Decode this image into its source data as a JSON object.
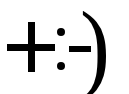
{
  "emoticon": {
    "text": "+:-)",
    "parts": {
      "plus": "+",
      "colon": ":",
      "dash": "-",
      "paren": ")"
    },
    "color": "#000000",
    "background": "#ffffff"
  }
}
